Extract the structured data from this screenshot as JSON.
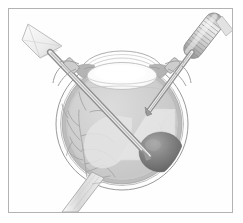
{
  "figure": {
    "caption": "",
    "border_color": "#b3b3b3",
    "background_color": "#ffffff",
    "width": 243,
    "height": 223
  },
  "palette": {
    "sclera_white": "#fdfdfd",
    "sclera_outline": "#9a9a9a",
    "choroid_gray": "#b8b8b8",
    "retina_gray": "#c9c9c9",
    "vitreous_gray": "#cfcfcf",
    "vitreous_light": "#dedede",
    "lens_white": "#ffffff",
    "lens_rim": "#c2c2c2",
    "lesion_dark": "#6f6f6f",
    "lesion_mid": "#8d8d8d",
    "instrument_gray": "#a8a8a8",
    "instrument_light": "#e6e6e6",
    "vessel_gray": "#a5a5a5",
    "light_cone": "#ededed",
    "optic_nerve_gray": "#d2d2d2",
    "outline_stroke": "#8e8e8e"
  },
  "anatomy": {
    "globe": {
      "label": "eyeball-globe",
      "cx": 122,
      "cy": 124,
      "rx": 66,
      "ry": 66
    },
    "cornea": {
      "label": "cornea",
      "description": "transparent dome arc at superior pole"
    },
    "lens": {
      "label": "crystalline-lens",
      "cx": 122,
      "cy": 75,
      "rx": 34,
      "ry": 13
    },
    "iris_left": {
      "label": "iris-ciliary-body-left"
    },
    "iris_right": {
      "label": "iris-ciliary-body-right"
    },
    "vitreous": {
      "label": "vitreous-cavity"
    },
    "retina": {
      "label": "retina-layer"
    },
    "choroid": {
      "label": "choroid-layer"
    },
    "sclera": {
      "label": "sclera-layer"
    },
    "optic_nerve": {
      "label": "optic-nerve-head-and-sheath",
      "exit_x": 88,
      "exit_y": 188
    },
    "lesion": {
      "label": "choroidal-lesion-tumor",
      "cx": 160,
      "cy": 152,
      "rx": 22,
      "ry": 20
    },
    "retinal_vessels_left": {
      "label": "retinal-vessels-left-branching"
    },
    "retinal_vessels_right": {
      "label": "retinal-vessels-right-faint"
    }
  },
  "instruments": {
    "left": {
      "name": "infusion-cannula",
      "handle_shape": "funnel-trumpet",
      "handle_tip_x": 30,
      "handle_tip_y": 24,
      "shaft_tip_x": 148,
      "shaft_tip_y": 155,
      "entry_x": 72,
      "entry_y": 70
    },
    "right": {
      "name": "vitrector-light-probe",
      "handle_shape": "ribbed-cylinder",
      "handle_top_x": 216,
      "handle_top_y": 20,
      "shaft_tip_x": 148,
      "shaft_tip_y": 110,
      "entry_x": 172,
      "entry_y": 70
    },
    "trocar_left": {
      "name": "trocar-cannula-left",
      "x": 72,
      "y": 70
    },
    "trocar_right": {
      "name": "trocar-cannula-right",
      "x": 172,
      "y": 70
    },
    "light_cone": {
      "name": "endoillumination-cone"
    }
  }
}
